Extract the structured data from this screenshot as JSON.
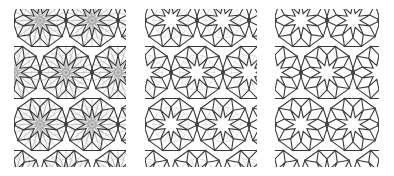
{
  "figure": {
    "background_color": "#ffffff",
    "width": 394,
    "height": 176,
    "panel_count": 3
  },
  "colors": {
    "background": "#ffffff",
    "pattern_stroke": "#3a3a3a",
    "construction_stroke": "#b8b8b8",
    "rosette_fan_stroke": "#9a9a9a",
    "underlay_stroke": "#cccccc"
  },
  "geometry": {
    "star_points": 10,
    "cell_width": 52,
    "cell_height": 52,
    "row_offset_x": 26,
    "star_outer_radius": 17.5,
    "star_inner_radius": 7.2,
    "pattern_stroke_width": 1.1,
    "construction_stroke_width": 0.55,
    "fan_stroke_width": 0.45
  },
  "panels": [
    {
      "id": "panel-1",
      "name": "construction-full",
      "label": "Stage 1 - full construction lines",
      "x": 14,
      "y": 9,
      "width": 112,
      "height": 158,
      "layers": [
        "rosette-fans",
        "polygon-underlay",
        "star-pattern"
      ],
      "show_fans": true,
      "show_underlay": true,
      "show_pattern": true
    },
    {
      "id": "panel-2",
      "name": "pattern-with-underlay",
      "label": "Stage 2 - pattern over light polygon underlay",
      "x": 145,
      "y": 9,
      "width": 112,
      "height": 158,
      "layers": [
        "polygon-underlay",
        "star-pattern"
      ],
      "show_fans": false,
      "show_underlay": true,
      "show_pattern": true
    },
    {
      "id": "panel-3",
      "name": "pattern-final",
      "label": "Stage 3 - final pattern only",
      "x": 275,
      "y": 9,
      "width": 104,
      "height": 158,
      "layers": [
        "star-pattern"
      ],
      "show_fans": false,
      "show_underlay": false,
      "show_pattern": true
    }
  ]
}
